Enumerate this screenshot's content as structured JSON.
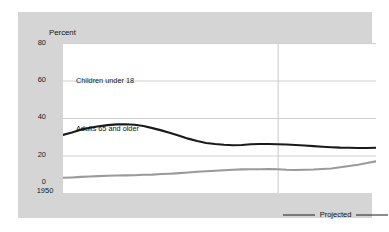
{
  "chart_data": {
    "type": "line",
    "title": "Percent",
    "xlabel": "",
    "ylabel": "Percent",
    "ylim": [
      0,
      80
    ],
    "xlim": [
      1950,
      2020
    ],
    "yticks": [
      0,
      20,
      40,
      60,
      80
    ],
    "xticks": [
      1950,
      1960,
      1970,
      1980,
      1990,
      1998,
      2010,
      2020
    ],
    "xtick_labels": [
      "1950",
      "1960",
      "1970",
      "1980",
      "1990",
      "1998",
      "2010",
      "2020"
    ],
    "grid": "horizontal",
    "legend_position": "bottom-right",
    "projection_start": 1998,
    "annotations": [
      {
        "text": "Children under 18",
        "x": 1957,
        "y": 45
      },
      {
        "text": "Adults 65 and older",
        "x": 1957,
        "y": 21
      }
    ],
    "series": [
      {
        "name": "Children under 18",
        "color": "#1a1a1a",
        "x": [
          1950,
          1952,
          1954,
          1956,
          1958,
          1960,
          1962,
          1964,
          1966,
          1968,
          1970,
          1972,
          1974,
          1976,
          1978,
          1980,
          1982,
          1984,
          1986,
          1988,
          1990,
          1992,
          1994,
          1996,
          1998,
          2000,
          2002,
          2004,
          2006,
          2008,
          2010,
          2012,
          2014,
          2016,
          2018,
          2020
        ],
        "values": [
          31.0,
          32.3,
          33.8,
          34.8,
          35.6,
          36.2,
          36.6,
          36.7,
          36.4,
          35.7,
          34.6,
          33.4,
          32.0,
          30.5,
          29.0,
          27.7,
          26.7,
          26.1,
          25.7,
          25.5,
          25.6,
          26.0,
          26.1,
          26.1,
          26.0,
          25.9,
          25.6,
          25.3,
          25.0,
          24.7,
          24.4,
          24.2,
          24.1,
          24.0,
          24.0,
          24.1
        ]
      },
      {
        "name": "Adults 65 and older",
        "color": "#9a9a9a",
        "x": [
          1950,
          1952,
          1954,
          1956,
          1958,
          1960,
          1962,
          1964,
          1966,
          1968,
          1970,
          1972,
          1974,
          1976,
          1978,
          1980,
          1982,
          1984,
          1986,
          1988,
          1990,
          1992,
          1994,
          1996,
          1998,
          2000,
          2002,
          2004,
          2006,
          2008,
          2010,
          2012,
          2014,
          2016,
          2018,
          2020
        ],
        "values": [
          8.1,
          8.3,
          8.6,
          8.8,
          9.0,
          9.2,
          9.3,
          9.4,
          9.5,
          9.7,
          9.8,
          10.1,
          10.3,
          10.6,
          10.9,
          11.3,
          11.6,
          11.9,
          12.1,
          12.4,
          12.6,
          12.7,
          12.7,
          12.8,
          12.7,
          12.4,
          12.3,
          12.4,
          12.5,
          12.8,
          13.1,
          13.7,
          14.4,
          15.1,
          16.0,
          16.9
        ]
      }
    ]
  },
  "axis": {
    "y_title": "Percent",
    "y_tick_0": "0",
    "y_tick_1": "20",
    "y_tick_2": "40",
    "y_tick_3": "60",
    "y_tick_4": "80",
    "x_tick_0": "1950",
    "x_tick_1": "1960",
    "x_tick_2": "1970",
    "x_tick_3": "1980",
    "x_tick_4": "1990",
    "x_tick_5": "1998",
    "x_tick_6": "2010",
    "x_tick_7": "2020"
  },
  "labels": {
    "children": "Children under 18",
    "elderly": "Adults 65 and older"
  },
  "legend": {
    "projected": "Projected"
  }
}
